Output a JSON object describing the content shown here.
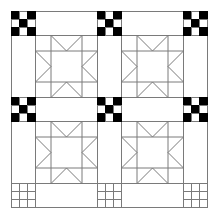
{
  "diagram": {
    "type": "quilt-pattern",
    "canvas": {
      "width": 216,
      "height": 217,
      "background": "#ffffff"
    },
    "colors": {
      "line": "#7a7a7a",
      "dark": "#000000",
      "light": "#ffffff"
    },
    "grid_lines": [
      11,
      35,
      97,
      121,
      183,
      207
    ],
    "cornerstone_rows": [
      {
        "row": 0,
        "style": "checkerboard"
      },
      {
        "row": 1,
        "style": "checkerboard"
      },
      {
        "row": 2,
        "style": "empty-grid"
      }
    ],
    "checkerboard_pattern": [
      [
        1,
        0,
        1
      ],
      [
        0,
        1,
        0
      ],
      [
        1,
        0,
        1
      ]
    ],
    "star_blocks": [
      {
        "row": 0,
        "col": 0,
        "x": 35,
        "y": 35,
        "size": 62
      },
      {
        "row": 0,
        "col": 1,
        "x": 121,
        "y": 35,
        "size": 62
      },
      {
        "row": 1,
        "col": 0,
        "x": 35,
        "y": 121,
        "size": 62
      },
      {
        "row": 1,
        "col": 1,
        "x": 121,
        "y": 121,
        "size": 62
      }
    ],
    "star_block_division": 0.25
  }
}
